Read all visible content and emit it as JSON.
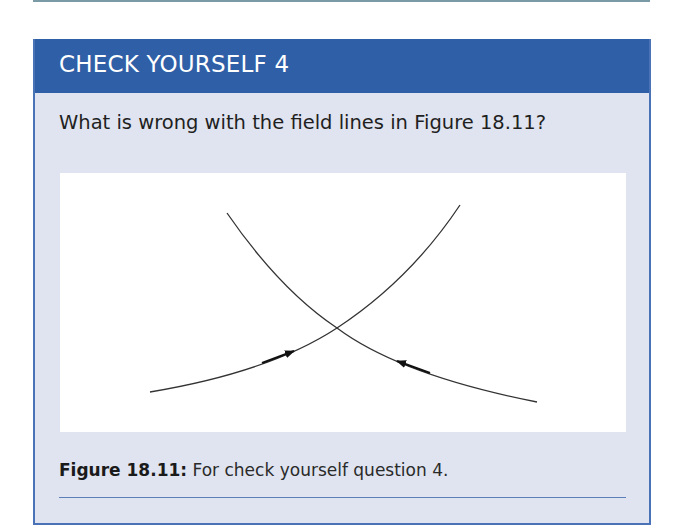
{
  "header": {
    "title": "CHECK YOURSELF 4"
  },
  "question": "What is wrong with the field lines in Figure 18.11?",
  "figure": {
    "lines": [
      {
        "name": "rising-field-line",
        "start": [
          150,
          392
        ],
        "end": [
          460,
          205
        ],
        "arrow_direction": "toward-crossing"
      },
      {
        "name": "falling-field-line",
        "start": [
          227,
          213
        ],
        "end": [
          537,
          402
        ],
        "arrow_direction": "toward-crossing"
      }
    ],
    "crossing_point": [
      337,
      328
    ]
  },
  "caption": {
    "label": "Figure 18.11:",
    "text": " For check yourself question 4."
  },
  "colors": {
    "header_bg": "#2f5fa7",
    "body_bg": "#dfe4f0",
    "border": "#4a72b6"
  }
}
